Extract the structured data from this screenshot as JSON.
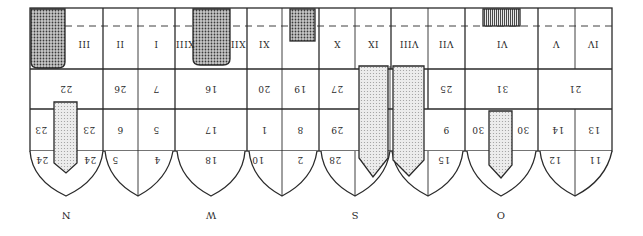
{
  "diagram": {
    "orientation": "rotated 180 degrees (scanned upside-down)",
    "colors": {
      "line": "#2a2a2a",
      "dark_fill": "#8a8a8a",
      "light_fill": "#d6d6d6",
      "background": "#ffffff"
    },
    "directions": [
      {
        "label": "N",
        "x": 54
      },
      {
        "label": "W",
        "x": 171
      },
      {
        "label": "S",
        "x": 290
      },
      {
        "label": "O",
        "x": 406
      }
    ],
    "row1_roman": [
      {
        "label": "III",
        "x": 84
      },
      {
        "label": "II",
        "x": 120
      },
      {
        "label": "I",
        "x": 156
      },
      {
        "label": "XIII",
        "x": 185
      },
      {
        "label": "XII",
        "x": 238
      },
      {
        "label": "XI",
        "x": 264
      },
      {
        "label": "X",
        "x": 337
      },
      {
        "label": "IX",
        "x": 373
      },
      {
        "label": "VIII",
        "x": 409
      },
      {
        "label": "VII",
        "x": 446
      },
      {
        "label": "VI",
        "x": 502
      },
      {
        "label": "V",
        "x": 556
      },
      {
        "label": "IV",
        "x": 593
      }
    ],
    "row2_numbers": [
      {
        "label": "22",
        "x": 66
      },
      {
        "label": "26",
        "x": 120
      },
      {
        "label": "7",
        "x": 156
      },
      {
        "label": "16",
        "x": 211
      },
      {
        "label": "20",
        "x": 264
      },
      {
        "label": "19",
        "x": 300
      },
      {
        "label": "27",
        "x": 337
      },
      {
        "label": "25",
        "x": 446
      },
      {
        "label": "31",
        "x": 502
      },
      {
        "label": "21",
        "x": 575
      }
    ],
    "row3_numbers": [
      {
        "label": "23",
        "x": 41
      },
      {
        "label": "23",
        "x": 89
      },
      {
        "label": "6",
        "x": 120
      },
      {
        "label": "5",
        "x": 156
      },
      {
        "label": "17",
        "x": 211
      },
      {
        "label": "1",
        "x": 264
      },
      {
        "label": "8",
        "x": 300
      },
      {
        "label": "29",
        "x": 337
      },
      {
        "label": "9",
        "x": 446
      },
      {
        "label": "30",
        "x": 478
      },
      {
        "label": "30",
        "x": 523
      },
      {
        "label": "14",
        "x": 558
      },
      {
        "label": "13",
        "x": 594
      }
    ],
    "row4_numbers": [
      {
        "label": "24",
        "x": 42
      },
      {
        "label": "24",
        "x": 90
      },
      {
        "label": "5",
        "x": 115
      },
      {
        "label": "4",
        "x": 157
      },
      {
        "label": "18",
        "x": 211
      },
      {
        "label": "10",
        "x": 258
      },
      {
        "label": "2",
        "x": 300
      },
      {
        "label": "28",
        "x": 335
      },
      {
        "label": "15",
        "x": 444
      },
      {
        "label": "12",
        "x": 555
      },
      {
        "label": "11",
        "x": 595
      }
    ]
  }
}
